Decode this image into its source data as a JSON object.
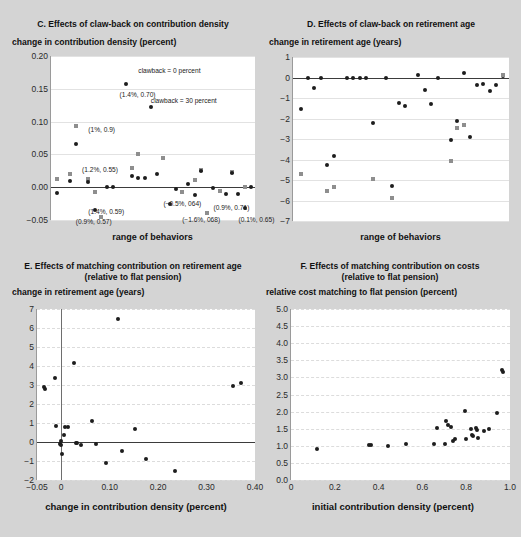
{
  "figure": {
    "background": "#d4d4d4",
    "marker_colors": {
      "circle": "#1d1d1d",
      "square": "#8e8e8e"
    }
  },
  "panels": {
    "C": {
      "title": "C. Effects of claw-back on contribution density",
      "ylabel": "change in contribution density (percent)",
      "xlabel": "range of behaviors",
      "legend": [
        {
          "label": "clawback = 0 percent",
          "marker": "square"
        },
        {
          "label": "clawback = 30 percent",
          "marker": "circle"
        }
      ],
      "annotations": [
        "(1.4%, 0.70)",
        "(1%, 0.9)",
        "(1.2%, 0.55)",
        "(1.4%, 0.59)",
        "(0.9%, 0.57)",
        "(−0.5%, 064)",
        "(−1.6%, 068)",
        "(0.9%, 0.71)",
        "(0.1%, 0.65)"
      ]
    },
    "D": {
      "title": "D. Effects of claw-back on retirement age",
      "ylabel": "change in retirement age (years)",
      "xlabel": "range of behaviors"
    },
    "E": {
      "title": "E. Effects of matching contribution on retirement age (relative to flat pension)",
      "ylabel": "change in retirement age (years)",
      "xlabel": "change in contribution density (percent)"
    },
    "F": {
      "title": "F. Effects of matching contribution on costs (relative to flat pension)",
      "ylabel": "relative cost matching to flat pension (percent)",
      "xlabel": "initial contribution density (percent)"
    }
  },
  "chart_data": [
    {
      "id": "C",
      "type": "scatter",
      "title": "C. Effects of claw-back on contribution density",
      "xlabel": "range of behaviors",
      "ylabel": "change in contribution density (percent)",
      "ylim": [
        -0.05,
        0.2
      ],
      "yticks": [
        "0.20",
        "0.15",
        "0.10",
        "0.05",
        "0.00",
        "−0.05"
      ],
      "ytickvals": [
        0.2,
        0.15,
        0.1,
        0.05,
        0.0,
        -0.05
      ],
      "xticks": [],
      "grid": true,
      "legend_position": "inside-top",
      "series": [
        {
          "name": "clawback = 0 percent",
          "marker": "square",
          "color": "#8e8e8e",
          "points": [
            [
              1,
              0.012
            ],
            [
              3,
              0.02
            ],
            [
              4,
              0.094
            ],
            [
              6,
              0.012
            ],
            [
              7,
              -0.008
            ],
            [
              8,
              -0.045
            ],
            [
              13,
              0.03
            ],
            [
              14,
              0.05
            ],
            [
              18,
              0.045
            ],
            [
              21,
              -0.007
            ],
            [
              23,
              0.011
            ],
            [
              24,
              0.026
            ],
            [
              25,
              -0.04
            ],
            [
              27,
              -0.006
            ],
            [
              29,
              0.023
            ],
            [
              31,
              0.0
            ]
          ]
        },
        {
          "name": "clawback = 30 percent",
          "marker": "circle",
          "color": "#1d1d1d",
          "points": [
            [
              1,
              -0.009
            ],
            [
              3,
              0.01
            ],
            [
              4,
              0.066
            ],
            [
              6,
              0.008
            ],
            [
              7,
              -0.034
            ],
            [
              9,
              0.0
            ],
            [
              10,
              0.0
            ],
            [
              12,
              0.158
            ],
            [
              13,
              0.017
            ],
            [
              14,
              0.014
            ],
            [
              15,
              0.014
            ],
            [
              16,
              0.122
            ],
            [
              17,
              0.02
            ],
            [
              19,
              -0.026
            ],
            [
              20,
              -0.003
            ],
            [
              22,
              0.005
            ],
            [
              23,
              -0.012
            ],
            [
              24,
              0.024
            ],
            [
              26,
              -0.001
            ],
            [
              28,
              -0.01
            ],
            [
              29,
              0.022
            ],
            [
              30,
              -0.011
            ],
            [
              31,
              -0.031
            ],
            [
              32,
              0.0
            ]
          ]
        }
      ],
      "annotations": [
        {
          "text": "clawback = 0 percent",
          "x": 14,
          "y": 0.183
        },
        {
          "text": "(1.4%, 0.70)",
          "x": 11,
          "y": 0.147
        },
        {
          "text": "clawback = 30 percent",
          "x": 16,
          "y": 0.137
        },
        {
          "text": "(1%, 0.9)",
          "x": 6,
          "y": 0.093
        },
        {
          "text": "(1.2%, 0.55)",
          "x": 5,
          "y": 0.033
        },
        {
          "text": "(1.4%, 0.59)",
          "x": 6,
          "y": -0.031
        },
        {
          "text": "(0.9%, 0.57)",
          "x": 4,
          "y": -0.047
        },
        {
          "text": "(−0.5%, 064)",
          "x": 18,
          "y": -0.019
        },
        {
          "text": "(−1.6%, 068)",
          "x": 21,
          "y": -0.044
        },
        {
          "text": "(0.9%, 0.71)",
          "x": 26,
          "y": -0.026
        },
        {
          "text": "(0.1%, 0.65)",
          "x": 30,
          "y": -0.044
        }
      ]
    },
    {
      "id": "D",
      "type": "scatter",
      "title": "D. Effects of claw-back on retirement age",
      "xlabel": "range of behaviors",
      "ylabel": "change in retirement age (years)",
      "ylim": [
        -7,
        1
      ],
      "yticks": [
        "1",
        "0",
        "−1",
        "−2",
        "−3",
        "−4",
        "−5",
        "−6",
        "−7"
      ],
      "ytickvals": [
        1,
        0,
        -1,
        -2,
        -3,
        -4,
        -5,
        -6,
        -7
      ],
      "xticks": [],
      "grid": true,
      "series": [
        {
          "name": "clawback = 30 percent",
          "marker": "circle",
          "color": "#1d1d1d",
          "points": [
            [
              1,
              -1.55
            ],
            [
              2,
              0.0
            ],
            [
              3,
              -0.52
            ],
            [
              4,
              0.0
            ],
            [
              5,
              -4.25
            ],
            [
              6,
              -3.85
            ],
            [
              8,
              0.0
            ],
            [
              9,
              0.0
            ],
            [
              10,
              0.0
            ],
            [
              11,
              0.0
            ],
            [
              12,
              -2.2
            ],
            [
              14,
              0.0
            ],
            [
              15,
              -5.3
            ],
            [
              16,
              -1.25
            ],
            [
              17,
              -1.4
            ],
            [
              19,
              0.12
            ],
            [
              20,
              -0.6
            ],
            [
              21,
              -1.3
            ],
            [
              22,
              0.0
            ],
            [
              24,
              -3.05
            ],
            [
              25,
              -2.1
            ],
            [
              26,
              0.22
            ],
            [
              27,
              -2.9
            ],
            [
              28,
              -0.38
            ],
            [
              29,
              -0.3
            ],
            [
              30,
              -0.65
            ],
            [
              31,
              -0.35
            ],
            [
              32,
              0.05
            ]
          ]
        },
        {
          "name": "clawback = 0 percent",
          "marker": "square",
          "color": "#8e8e8e",
          "points": [
            [
              1,
              -4.7
            ],
            [
              5,
              -5.55
            ],
            [
              6,
              -5.35
            ],
            [
              12,
              -4.95
            ],
            [
              15,
              -5.9
            ],
            [
              24,
              -4.05
            ],
            [
              25,
              -2.45
            ],
            [
              26,
              -2.3
            ],
            [
              32,
              0.1
            ]
          ]
        }
      ]
    },
    {
      "id": "E",
      "type": "scatter",
      "title": "E. Effects of matching contribution on retirement age (relative to flat pension)",
      "xlabel": "change in contribution density (percent)",
      "ylabel": "change in retirement age (years)",
      "xlim": [
        -0.05,
        0.4
      ],
      "ylim": [
        -2,
        7
      ],
      "xticks": [
        "−0.05",
        "0",
        "0.10",
        "0.20",
        "0.30",
        "0.40"
      ],
      "xtickvals": [
        -0.05,
        0.0,
        0.1,
        0.2,
        0.3,
        0.4
      ],
      "yticks": [
        "7",
        "6",
        "5",
        "4",
        "3",
        "2",
        "1",
        "0",
        "−1",
        "−2"
      ],
      "ytickvals": [
        7,
        6,
        5,
        4,
        3,
        2,
        1,
        0,
        -1,
        -2
      ],
      "grid": true,
      "marker": "circle",
      "color": "#1d1d1d",
      "points": [
        [
          -0.035,
          2.92
        ],
        [
          -0.034,
          2.8
        ],
        [
          -0.012,
          3.38
        ],
        [
          -0.01,
          0.85
        ],
        [
          -0.002,
          -0.1
        ],
        [
          -0.001,
          0.05
        ],
        [
          0.0,
          -0.18
        ],
        [
          0.002,
          -0.62
        ],
        [
          0.006,
          0.35
        ],
        [
          0.008,
          0.8
        ],
        [
          0.013,
          0.8
        ],
        [
          0.026,
          4.14
        ],
        [
          0.03,
          -0.05
        ],
        [
          0.033,
          -0.07
        ],
        [
          0.04,
          -0.17
        ],
        [
          0.063,
          1.12
        ],
        [
          0.072,
          -0.08
        ],
        [
          0.093,
          -1.1
        ],
        [
          0.118,
          6.45
        ],
        [
          0.125,
          -0.47
        ],
        [
          0.152,
          0.7
        ],
        [
          0.175,
          -0.88
        ],
        [
          0.235,
          -1.5
        ],
        [
          0.355,
          2.93
        ],
        [
          0.372,
          3.12
        ]
      ]
    },
    {
      "id": "F",
      "type": "scatter",
      "title": "F. Effects of matching contribution on costs (relative to flat pension)",
      "xlabel": "initial contribution density (percent)",
      "ylabel": "relative cost matching to flat pension (percent)",
      "xlim": [
        0,
        1.0
      ],
      "ylim": [
        0.0,
        5.0
      ],
      "xticks": [
        "0",
        "0.2",
        "0.4",
        "0.6",
        "0.8",
        "1.0"
      ],
      "xtickvals": [
        0,
        0.2,
        0.4,
        0.6,
        0.8,
        1.0
      ],
      "yticks": [
        "5.0",
        "4.5",
        "4.0",
        "3.5",
        "3.0",
        "2.5",
        "2.0",
        "1.5",
        "1.0",
        "0.5",
        "0.0"
      ],
      "ytickvals": [
        5.0,
        4.5,
        4.0,
        3.5,
        3.0,
        2.5,
        2.0,
        1.5,
        1.0,
        0.5,
        0.0
      ],
      "grid": true,
      "marker": "circle",
      "color": "#1d1d1d",
      "points": [
        [
          0.12,
          0.9
        ],
        [
          0.355,
          1.02
        ],
        [
          0.365,
          1.02
        ],
        [
          0.445,
          1.0
        ],
        [
          0.525,
          1.06
        ],
        [
          0.655,
          1.05
        ],
        [
          0.665,
          1.52
        ],
        [
          0.705,
          1.05
        ],
        [
          0.71,
          1.72
        ],
        [
          0.715,
          1.62
        ],
        [
          0.73,
          1.55
        ],
        [
          0.74,
          1.15
        ],
        [
          0.75,
          1.2
        ],
        [
          0.795,
          2.02
        ],
        [
          0.8,
          1.2
        ],
        [
          0.82,
          1.5
        ],
        [
          0.825,
          1.32
        ],
        [
          0.83,
          1.28
        ],
        [
          0.845,
          1.52
        ],
        [
          0.85,
          1.45
        ],
        [
          0.855,
          1.22
        ],
        [
          0.88,
          1.42
        ],
        [
          0.905,
          1.48
        ],
        [
          0.94,
          1.95
        ],
        [
          0.965,
          3.22
        ],
        [
          0.968,
          3.15
        ]
      ]
    }
  ]
}
